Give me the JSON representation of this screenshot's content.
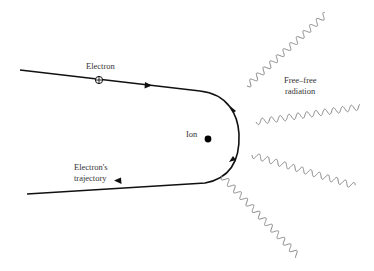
{
  "diagram": {
    "labels": {
      "electron": "Electron",
      "ion": "Ion",
      "radiation_line1": "Free–free",
      "radiation_line2": "radiation",
      "trajectory_line1": "Electron's",
      "trajectory_line2": "trajectory"
    },
    "colors": {
      "trajectory": "#111111",
      "wave": "#888888",
      "text": "#333333"
    },
    "waves": [
      {
        "from": [
          247,
          86
        ],
        "to": [
          326,
          14
        ]
      },
      {
        "from": [
          256,
          122
        ],
        "to": [
          360,
          107
        ]
      },
      {
        "from": [
          252,
          155
        ],
        "to": [
          355,
          186
        ]
      },
      {
        "from": [
          222,
          176
        ],
        "to": [
          298,
          256
        ]
      }
    ]
  }
}
